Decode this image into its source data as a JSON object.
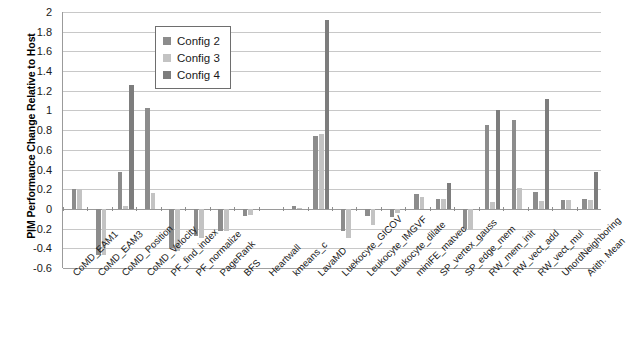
{
  "chart_data": {
    "type": "bar",
    "title": "",
    "xlabel": "",
    "ylabel": "PIM Performance Change Relative to Host",
    "ylim": [
      -0.6,
      2
    ],
    "ytick_labels": [
      "2",
      "1.8",
      "1.6",
      "1.4",
      "1.2",
      "1",
      "0.8",
      "0.6",
      "0.4",
      "0.2",
      "0",
      "-0.2",
      "-0.4",
      "-0.6"
    ],
    "ytick_values": [
      2,
      1.8,
      1.6,
      1.4,
      1.2,
      1,
      0.8,
      0.6,
      0.4,
      0.2,
      0,
      -0.2,
      -0.4,
      -0.6
    ],
    "grid": true,
    "legend_position": "upper-left-inside",
    "categories": [
      "CoMD_EAM1",
      "CoMD_EAM3",
      "CoMD_Position",
      "CoMD_Velocity",
      "PF_find_index",
      "PF_normalize",
      "PageRank",
      "BFS",
      "Heartwall",
      "kmeans_c",
      "LavaMD",
      "Luekocyte_GICOV",
      "Leukocyte_IMGVF",
      "Leukocyte_dilate",
      "miniFE_matvec",
      "SP_vertex_gauss",
      "SP_edge_mem",
      "RW_mem_init",
      "RW_vect_add",
      "RW_vect_mul",
      "UnordNeighboring",
      "Arith. Mean"
    ],
    "series": [
      {
        "name": "Config 2",
        "color": "#8c8c8c",
        "values": [
          0.2,
          -0.47,
          0.38,
          1.02,
          -0.4,
          -0.28,
          -0.22,
          -0.07,
          0.0,
          0.03,
          0.74,
          -0.22,
          -0.07,
          -0.08,
          0.15,
          0.1,
          -0.2,
          0.85,
          0.9,
          0.17,
          0.09,
          0.1
        ]
      },
      {
        "name": "Config 3",
        "color": "#c3c3c3",
        "values": [
          0.2,
          -0.47,
          0.03,
          0.16,
          -0.43,
          -0.3,
          -0.22,
          -0.06,
          0.0,
          0.01,
          0.76,
          -0.3,
          -0.16,
          -0.04,
          0.12,
          0.1,
          -0.21,
          0.07,
          0.21,
          0.08,
          0.09,
          0.09
        ]
      },
      {
        "name": "Config 4",
        "color": "#7d7d7d",
        "values": [
          0.0,
          0.0,
          1.26,
          0.0,
          0.0,
          0.0,
          0.0,
          0.0,
          0.0,
          0.0,
          1.92,
          0.0,
          0.0,
          0.0,
          0.0,
          0.26,
          0.0,
          1.0,
          0.0,
          1.12,
          0.0,
          0.37
        ]
      }
    ]
  },
  "legend": {
    "items": [
      {
        "label": "Config 2",
        "color": "#8c8c8c"
      },
      {
        "label": "Config 3",
        "color": "#c3c3c3"
      },
      {
        "label": "Config 4",
        "color": "#7d7d7d"
      }
    ]
  }
}
